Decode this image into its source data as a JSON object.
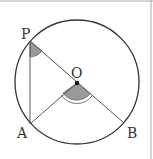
{
  "diagram": {
    "type": "geometry-circle",
    "colors": {
      "stroke": "#333333",
      "chord": "#555555",
      "angle_fill": "#9a9a9a",
      "frame": "#aaaaaa"
    },
    "points": {
      "P": {
        "label": "P",
        "x": 30,
        "y": 41
      },
      "O": {
        "label": "O",
        "x": 77,
        "y": 83
      },
      "A": {
        "label": "A",
        "x": 30,
        "y": 124
      },
      "B": {
        "label": "B",
        "x": 124,
        "y": 123
      }
    },
    "circle": {
      "center": "O",
      "radius": 62
    },
    "segments": [
      "PA",
      "PB",
      "AO"
    ],
    "marked_angles": [
      "APO",
      "AOB"
    ]
  }
}
